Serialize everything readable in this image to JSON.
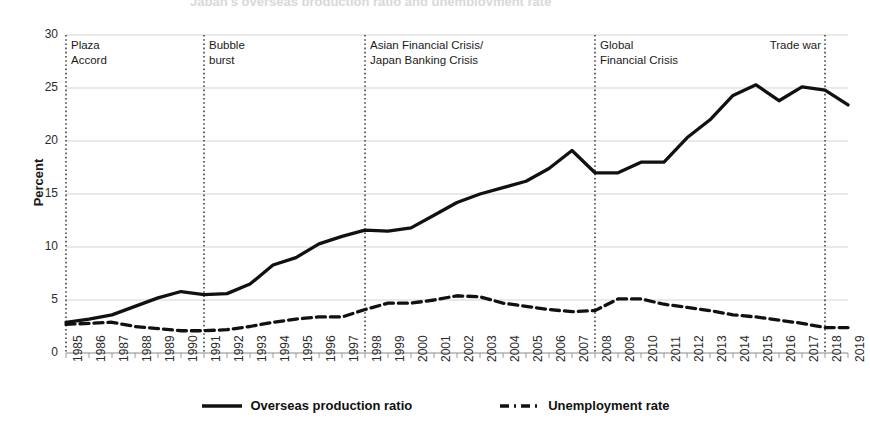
{
  "figure": {
    "clipped_title": "Japan's overseas production ratio and unemployment rate",
    "ylabel": "Percent"
  },
  "chart_data": {
    "type": "line",
    "title": "",
    "xlabel": "",
    "ylabel": "Percent",
    "ylim": [
      0,
      30
    ],
    "yticks": [
      0,
      5,
      10,
      15,
      20,
      25,
      30
    ],
    "grid": true,
    "legend_position": "bottom",
    "categories": [
      "1985",
      "1986",
      "1987",
      "1988",
      "1989",
      "1990",
      "1991",
      "1992",
      "1993",
      "1994",
      "1995",
      "1996",
      "1997",
      "1998",
      "1999",
      "2000",
      "2001",
      "2002",
      "2003",
      "2004",
      "2005",
      "2006",
      "2007",
      "2008",
      "2009",
      "2010",
      "2011",
      "2012",
      "2013",
      "2014",
      "2015",
      "2016",
      "2017",
      "2018",
      "2019"
    ],
    "series": [
      {
        "name": "Overseas production ratio",
        "style": "solid",
        "color": "#111111",
        "values": [
          2.9,
          3.2,
          3.6,
          4.4,
          5.2,
          5.8,
          5.5,
          5.6,
          6.5,
          7.5,
          8.3,
          9.4,
          10.4,
          11.0,
          11.6,
          11.8,
          11.9,
          11.6,
          11.7,
          12.9,
          14.2,
          14.9,
          15.7,
          16.6,
          17.8,
          19.1,
          17.0,
          17.0,
          17.2,
          18.0,
          18.0,
          20.0,
          21.6,
          23.2,
          24.3
        ]
      },
      {
        "name": "Unemployment rate",
        "style": "dashed",
        "color": "#111111",
        "values": [
          2.6,
          2.8,
          2.8,
          2.5,
          2.3,
          2.1,
          2.1,
          2.2,
          2.5,
          2.9,
          3.2,
          3.4,
          3.4,
          4.1,
          4.7,
          4.7,
          5.0,
          5.4,
          5.3,
          4.7,
          4.4,
          4.1,
          3.9,
          4.0,
          5.1,
          5.1,
          4.6,
          4.3,
          4.0,
          3.6,
          3.4,
          3.1,
          2.8,
          2.4,
          2.4
        ]
      }
    ],
    "series_plotted": {
      "overseas_production_ratio": [
        {
          "year": "1985",
          "value": 2.9
        },
        {
          "year": "1986",
          "value": 3.2
        },
        {
          "year": "1987",
          "value": 3.6
        },
        {
          "year": "1988",
          "value": 4.4
        },
        {
          "year": "1989",
          "value": 5.2
        },
        {
          "year": "1990",
          "value": 5.8
        },
        {
          "year": "1991",
          "value": 5.5
        },
        {
          "year": "1992",
          "value": 5.6
        },
        {
          "year": "1993",
          "value": 6.5
        },
        {
          "year": "1994",
          "value": 8.3
        },
        {
          "year": "1995",
          "value": 9.0
        },
        {
          "year": "1996",
          "value": 10.3
        },
        {
          "year": "1997",
          "value": 11.0
        },
        {
          "year": "1998",
          "value": 11.6
        },
        {
          "year": "1999",
          "value": 11.5
        },
        {
          "year": "2000",
          "value": 11.8
        },
        {
          "year": "2001",
          "value": 13.0
        },
        {
          "year": "2002",
          "value": 14.2
        },
        {
          "year": "2003",
          "value": 15.0
        },
        {
          "year": "2004",
          "value": 15.6
        },
        {
          "year": "2005",
          "value": 16.2
        },
        {
          "year": "2006",
          "value": 17.4
        },
        {
          "year": "2007",
          "value": 19.1
        },
        {
          "year": "2008",
          "value": 17.0
        },
        {
          "year": "2009",
          "value": 17.0
        },
        {
          "year": "2010",
          "value": 18.0
        },
        {
          "year": "2011",
          "value": 18.0
        },
        {
          "year": "2012",
          "value": 20.3
        },
        {
          "year": "2013",
          "value": 22.0
        },
        {
          "year": "2014",
          "value": 24.3
        },
        {
          "year": "2015",
          "value": 25.3
        },
        {
          "year": "2016",
          "value": 23.8
        },
        {
          "year": "2017",
          "value": 25.1
        },
        {
          "year": "2018",
          "value": 24.8
        },
        {
          "year": "2019",
          "value": 23.4
        }
      ],
      "unemployment_rate": [
        {
          "year": "1985",
          "value": 2.7
        },
        {
          "year": "1986",
          "value": 2.8
        },
        {
          "year": "1987",
          "value": 2.9
        },
        {
          "year": "1988",
          "value": 2.5
        },
        {
          "year": "1989",
          "value": 2.3
        },
        {
          "year": "1990",
          "value": 2.1
        },
        {
          "year": "1991",
          "value": 2.1
        },
        {
          "year": "1992",
          "value": 2.2
        },
        {
          "year": "1993",
          "value": 2.5
        },
        {
          "year": "1994",
          "value": 2.9
        },
        {
          "year": "1995",
          "value": 3.2
        },
        {
          "year": "1996",
          "value": 3.4
        },
        {
          "year": "1997",
          "value": 3.4
        },
        {
          "year": "1998",
          "value": 4.1
        },
        {
          "year": "1999",
          "value": 4.7
        },
        {
          "year": "2000",
          "value": 4.7
        },
        {
          "year": "2001",
          "value": 5.0
        },
        {
          "year": "2002",
          "value": 5.4
        },
        {
          "year": "2003",
          "value": 5.3
        },
        {
          "year": "2004",
          "value": 4.7
        },
        {
          "year": "2005",
          "value": 4.4
        },
        {
          "year": "2006",
          "value": 4.1
        },
        {
          "year": "2007",
          "value": 3.9
        },
        {
          "year": "2008",
          "value": 4.0
        },
        {
          "year": "2009",
          "value": 5.1
        },
        {
          "year": "2010",
          "value": 5.1
        },
        {
          "year": "2011",
          "value": 4.6
        },
        {
          "year": "2012",
          "value": 4.3
        },
        {
          "year": "2013",
          "value": 4.0
        },
        {
          "year": "2014",
          "value": 3.6
        },
        {
          "year": "2015",
          "value": 3.4
        },
        {
          "year": "2016",
          "value": 3.1
        },
        {
          "year": "2017",
          "value": 2.8
        },
        {
          "year": "2018",
          "value": 2.4
        },
        {
          "year": "2019",
          "value": 2.4
        }
      ]
    },
    "annotations": [
      {
        "id": "plaza-accord",
        "at_year": "1985",
        "lines": [
          "Plaza",
          "Accord"
        ],
        "align": "left"
      },
      {
        "id": "bubble-burst",
        "at_year": "1991",
        "lines": [
          "Bubble",
          "burst"
        ],
        "align": "left"
      },
      {
        "id": "asian-crisis",
        "at_year": "1998",
        "lines": [
          "Asian Financial Crisis/",
          "Japan Banking Crisis"
        ],
        "align": "left"
      },
      {
        "id": "global-crisis",
        "at_year": "2008",
        "lines": [
          "Global",
          "Financial Crisis"
        ],
        "align": "left"
      },
      {
        "id": "trade-war",
        "at_year": "2018",
        "lines": [
          "Trade war"
        ],
        "align": "right"
      }
    ],
    "legend": [
      {
        "name": "Overseas production ratio",
        "style": "solid"
      },
      {
        "name": "Unemployment rate",
        "style": "dashed"
      }
    ]
  }
}
